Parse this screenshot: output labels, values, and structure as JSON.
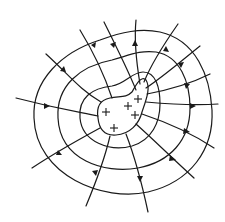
{
  "figure": {
    "title": "Electric field lines and equipotential surfaces around a charged conductor",
    "stroke_color": "#1a1a1a",
    "background": "#ffffff"
  },
  "conductor": {
    "shape": "irregular-blob",
    "charges": [
      {
        "symbol": "+",
        "x": 106,
        "y": 112
      },
      {
        "symbol": "+",
        "x": 128,
        "y": 106
      },
      {
        "symbol": "+",
        "x": 138,
        "y": 99
      },
      {
        "symbol": "+",
        "x": 135,
        "y": 115
      },
      {
        "symbol": "+",
        "x": 114,
        "y": 128
      }
    ]
  },
  "equipotentials": {
    "count": 3,
    "labels": [
      "inner",
      "middle",
      "outer"
    ]
  },
  "field_lines": {
    "count": 16,
    "direction": "outward"
  }
}
